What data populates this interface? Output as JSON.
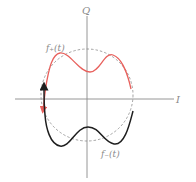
{
  "diagram": {
    "axes": {
      "horizontal_label": "I",
      "vertical_label": "Q"
    },
    "reference_circle": {
      "style": "dashed"
    },
    "curves": [
      {
        "name": "f-plus",
        "label": "f₊(t)",
        "color": "#e8605c",
        "arrow": "down"
      },
      {
        "name": "f-minus",
        "label": "f₋(t)",
        "color": "#1e1e1e",
        "arrow": "up"
      }
    ]
  }
}
